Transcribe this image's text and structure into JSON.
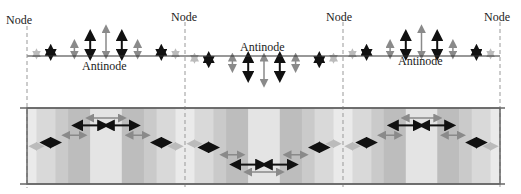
{
  "labels": {
    "node": "Node",
    "antinode": "Antinode"
  },
  "nodes_x": [
    27,
    185,
    343,
    500
  ],
  "baseline_y": 56,
  "band": {
    "top": 108,
    "bottom": 184,
    "left": 27,
    "right": 500
  },
  "colors": {
    "dark_arrow": "#111111",
    "light_arrow": "#8a8a8a",
    "faint_arrow": "#bbbbbb",
    "node_line": "#999999",
    "baseline": "#333333",
    "band_border": "#666666",
    "stripe_1": "#eaeaea",
    "stripe_2": "#d9d9d9",
    "stripe_3": "#cacaca",
    "stripe_4": "#bdbdbd",
    "center_stripe": "#e4e4e4"
  },
  "segments": [
    {
      "direction": "up",
      "antinode_label": "Antinode"
    },
    {
      "direction": "down",
      "antinode_label": "Antinode"
    },
    {
      "direction": "up",
      "antinode_label": "Antinode"
    }
  ],
  "arrow_profile": [
    {
      "offset": 0.06,
      "size": 3,
      "shade": "faint"
    },
    {
      "offset": 0.15,
      "size": 6,
      "shade": "dark"
    },
    {
      "offset": 0.3,
      "size": 12,
      "shade": "light"
    },
    {
      "offset": 0.4,
      "size": 20,
      "shade": "dark"
    },
    {
      "offset": 0.5,
      "size": 26,
      "shade": "light"
    },
    {
      "offset": 0.6,
      "size": 20,
      "shade": "dark"
    },
    {
      "offset": 0.7,
      "size": 12,
      "shade": "light"
    },
    {
      "offset": 0.85,
      "size": 6,
      "shade": "dark"
    },
    {
      "offset": 0.94,
      "size": 3,
      "shade": "faint"
    }
  ]
}
